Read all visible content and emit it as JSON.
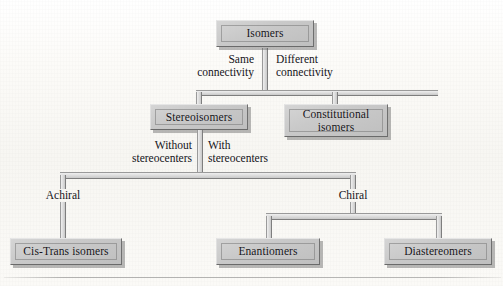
{
  "diagram": {
    "background_color": "#fbfaf7",
    "node_fill_color": "#c9c9c9",
    "node_border_color": "#6f6f6f",
    "connector_color": "#cfcfcf",
    "text_color": "#141317",
    "nodes": [
      {
        "id": "isomers",
        "label": "Isomers",
        "level": 1
      },
      {
        "id": "stereoisomers",
        "label": "Stereoisomers",
        "level": 2
      },
      {
        "id": "constitutional",
        "label": "Constitutional\nisomers",
        "line1": "Constitutional",
        "line2": "isomers",
        "level": 2
      },
      {
        "id": "cis-trans",
        "label": "Cis-Trans isomers",
        "level": 3
      },
      {
        "id": "enantiomers",
        "label": "Enantiomers",
        "level": 3
      },
      {
        "id": "diastereomers",
        "label": "Diastereomers",
        "level": 3
      }
    ],
    "edge_labels": [
      {
        "id": "same-connectivity",
        "line1": "Same",
        "line2": "connectivity",
        "from": "isomers",
        "to": "stereoisomers"
      },
      {
        "id": "different-connectivity",
        "line1": "Different",
        "line2": "connectivity",
        "from": "isomers",
        "to": "constitutional"
      },
      {
        "id": "without-stereocenters",
        "line1": "Without",
        "line2": "stereocenters",
        "from": "stereoisomers",
        "to": "achiral"
      },
      {
        "id": "with-stereocenters",
        "line1": "With",
        "line2": "stereocenters",
        "from": "stereoisomers",
        "to": "chiral"
      },
      {
        "id": "achiral",
        "line1": "Achiral",
        "line2": "",
        "from": "stereoisomers",
        "to": "cis-trans"
      },
      {
        "id": "chiral",
        "line1": "Chiral",
        "line2": "",
        "from": "stereoisomers",
        "to": "enantiomers"
      }
    ]
  }
}
